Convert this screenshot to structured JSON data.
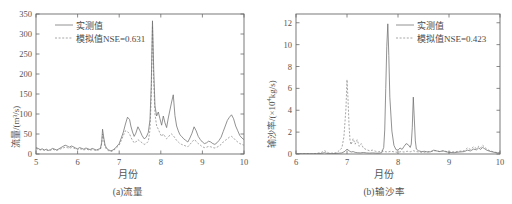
{
  "figure": {
    "background": "#ffffff",
    "line_color_observed": "#6e6e6e",
    "line_color_simulated": "#8a8a8a"
  },
  "panels": {
    "a": {
      "caption": "(a)流量",
      "xlabel": "月份",
      "ylabel": "流量/(m³/s)",
      "legend": {
        "observed": "实测值",
        "simulated": "模拟值NSE=0.631"
      },
      "xticks": [
        "5",
        "6",
        "7",
        "8",
        "9",
        "10"
      ],
      "yticks": [
        "0",
        "50",
        "100",
        "150",
        "200",
        "250",
        "300",
        "350"
      ]
    },
    "b": {
      "caption": "(b)输沙率",
      "xlabel": "月份",
      "ylabel_pre": "输沙率/(×10",
      "ylabel_sup": "4",
      "ylabel_post": "kg/s)",
      "legend": {
        "observed": "实测值",
        "simulated": "模拟值NSE=0.423"
      },
      "xticks": [
        "6",
        "7",
        "8",
        "9",
        "10"
      ],
      "yticks": [
        "0",
        "2",
        "4",
        "6",
        "8",
        "10",
        "12"
      ]
    }
  },
  "chart_data": [
    {
      "type": "line",
      "title": "(a)流量",
      "xlabel": "月份",
      "ylabel": "流量/(m³/s)",
      "xlim": [
        5,
        10
      ],
      "ylim": [
        0,
        350
      ],
      "xticks": [
        5,
        6,
        7,
        8,
        9,
        10
      ],
      "yticks": [
        0,
        50,
        100,
        150,
        200,
        250,
        300,
        350
      ],
      "grid": false,
      "legend_position": "upper-left",
      "series": [
        {
          "name": "实测值",
          "style": "solid",
          "x": [
            5.0,
            5.05,
            5.1,
            5.15,
            5.2,
            5.25,
            5.3,
            5.35,
            5.4,
            5.45,
            5.5,
            5.55,
            5.6,
            5.65,
            5.7,
            5.75,
            5.8,
            5.85,
            5.9,
            5.95,
            6.0,
            6.05,
            6.1,
            6.15,
            6.2,
            6.25,
            6.3,
            6.35,
            6.4,
            6.45,
            6.5,
            6.55,
            6.58,
            6.6,
            6.63,
            6.66,
            6.7,
            6.75,
            6.8,
            6.85,
            6.9,
            6.95,
            7.0,
            7.05,
            7.1,
            7.15,
            7.2,
            7.25,
            7.28,
            7.32,
            7.36,
            7.4,
            7.45,
            7.5,
            7.55,
            7.6,
            7.65,
            7.7,
            7.74,
            7.77,
            7.8,
            7.83,
            7.86,
            7.9,
            7.94,
            7.98,
            8.02,
            8.06,
            8.1,
            8.14,
            8.18,
            8.22,
            8.26,
            8.3,
            8.34,
            8.38,
            8.42,
            8.46,
            8.5,
            8.55,
            8.6,
            8.65,
            8.7,
            8.75,
            8.8,
            8.85,
            8.9,
            8.95,
            9.0,
            9.05,
            9.1,
            9.15,
            9.2,
            9.25,
            9.3,
            9.35,
            9.4,
            9.45,
            9.5,
            9.55,
            9.6,
            9.65,
            9.7,
            9.75,
            9.8,
            9.85,
            9.9,
            9.95,
            10.0
          ],
          "y": [
            16,
            14,
            11,
            13,
            10,
            12,
            9,
            11,
            14,
            12,
            10,
            13,
            16,
            19,
            22,
            20,
            17,
            20,
            18,
            15,
            13,
            16,
            14,
            12,
            15,
            13,
            11,
            14,
            12,
            10,
            12,
            14,
            30,
            62,
            40,
            22,
            14,
            10,
            8,
            10,
            14,
            20,
            26,
            40,
            55,
            75,
            92,
            86,
            70,
            55,
            44,
            52,
            68,
            58,
            46,
            38,
            42,
            54,
            85,
            170,
            333,
            210,
            120,
            95,
            105,
            88,
            72,
            95,
            78,
            66,
            90,
            110,
            130,
            148,
            96,
            70,
            58,
            48,
            44,
            38,
            34,
            30,
            40,
            52,
            68,
            58,
            44,
            36,
            30,
            26,
            28,
            32,
            30,
            26,
            24,
            28,
            34,
            42,
            56,
            70,
            84,
            92,
            98,
            88,
            70,
            58,
            46,
            40,
            36
          ]
        },
        {
          "name": "模拟值NSE=0.631",
          "style": "dashed",
          "x": [
            5.0,
            5.05,
            5.1,
            5.15,
            5.2,
            5.25,
            5.3,
            5.35,
            5.4,
            5.45,
            5.5,
            5.55,
            5.6,
            5.65,
            5.7,
            5.75,
            5.8,
            5.85,
            5.9,
            5.95,
            6.0,
            6.05,
            6.1,
            6.15,
            6.2,
            6.25,
            6.3,
            6.35,
            6.4,
            6.45,
            6.5,
            6.55,
            6.58,
            6.6,
            6.63,
            6.66,
            6.7,
            6.75,
            6.8,
            6.85,
            6.9,
            6.95,
            7.0,
            7.05,
            7.1,
            7.15,
            7.2,
            7.25,
            7.28,
            7.32,
            7.36,
            7.4,
            7.45,
            7.5,
            7.55,
            7.6,
            7.65,
            7.7,
            7.74,
            7.77,
            7.8,
            7.83,
            7.86,
            7.9,
            7.94,
            7.98,
            8.02,
            8.06,
            8.1,
            8.14,
            8.18,
            8.22,
            8.26,
            8.3,
            8.34,
            8.38,
            8.42,
            8.46,
            8.5,
            8.55,
            8.6,
            8.65,
            8.7,
            8.75,
            8.8,
            8.85,
            8.9,
            8.95,
            9.0,
            9.05,
            9.1,
            9.15,
            9.2,
            9.25,
            9.3,
            9.35,
            9.4,
            9.45,
            9.5,
            9.55,
            9.6,
            9.65,
            9.7,
            9.75,
            9.8,
            9.85,
            9.9,
            9.95,
            10.0
          ],
          "y": [
            14,
            12,
            10,
            11,
            9,
            10,
            8,
            9,
            12,
            10,
            9,
            11,
            13,
            15,
            17,
            16,
            14,
            16,
            15,
            13,
            11,
            13,
            12,
            10,
            12,
            11,
            9,
            11,
            10,
            8,
            10,
            12,
            26,
            50,
            34,
            18,
            11,
            8,
            6,
            8,
            12,
            17,
            22,
            34,
            46,
            58,
            56,
            50,
            42,
            34,
            28,
            30,
            36,
            32,
            28,
            24,
            26,
            32,
            60,
            140,
            320,
            180,
            100,
            70,
            62,
            52,
            44,
            50,
            44,
            38,
            42,
            48,
            50,
            46,
            40,
            34,
            30,
            26,
            24,
            22,
            20,
            18,
            24,
            30,
            36,
            32,
            26,
            22,
            18,
            16,
            17,
            19,
            18,
            16,
            15,
            17,
            20,
            24,
            30,
            34,
            38,
            42,
            44,
            40,
            34,
            30,
            26,
            24,
            22
          ]
        }
      ]
    },
    {
      "type": "line",
      "title": "(b)输沙率",
      "xlabel": "月份",
      "ylabel": "输沙率/(×10⁴kg/s)",
      "xlim": [
        6,
        10
      ],
      "ylim": [
        0,
        12.8
      ],
      "xticks": [
        6,
        7,
        8,
        9,
        10
      ],
      "yticks": [
        0,
        2,
        4,
        6,
        8,
        10,
        12
      ],
      "grid": false,
      "legend_position": "upper-right",
      "series": [
        {
          "name": "实测值",
          "style": "solid",
          "x": [
            6.0,
            6.1,
            6.2,
            6.3,
            6.4,
            6.5,
            6.56,
            6.6,
            6.64,
            6.7,
            6.8,
            6.9,
            6.96,
            7.0,
            7.04,
            7.08,
            7.12,
            7.16,
            7.2,
            7.26,
            7.32,
            7.38,
            7.44,
            7.5,
            7.56,
            7.62,
            7.68,
            7.72,
            7.74,
            7.76,
            7.78,
            7.8,
            7.82,
            7.84,
            7.88,
            7.92,
            7.96,
            8.0,
            8.04,
            8.08,
            8.12,
            8.16,
            8.2,
            8.24,
            8.26,
            8.28,
            8.3,
            8.32,
            8.34,
            8.36,
            8.4,
            8.46,
            8.52,
            8.58,
            8.64,
            8.7,
            8.76,
            8.82,
            8.88,
            8.94,
            9.0,
            9.1,
            9.2,
            9.3,
            9.36,
            9.42,
            9.48,
            9.54,
            9.58,
            9.62,
            9.66,
            9.7,
            9.74,
            9.8,
            9.86,
            9.92,
            10.0
          ],
          "y": [
            0.02,
            0.02,
            0.03,
            0.02,
            0.03,
            0.05,
            0.12,
            0.06,
            0.04,
            0.03,
            0.05,
            0.1,
            0.25,
            0.45,
            0.3,
            0.18,
            0.22,
            0.15,
            0.12,
            0.1,
            0.14,
            0.1,
            0.08,
            0.1,
            0.08,
            0.07,
            0.12,
            0.6,
            2.2,
            6.0,
            9.8,
            11.9,
            9.0,
            5.2,
            2.1,
            0.8,
            0.4,
            0.35,
            0.55,
            0.42,
            0.7,
            0.95,
            0.85,
            0.6,
            0.9,
            2.4,
            5.2,
            3.2,
            1.2,
            0.45,
            0.3,
            0.22,
            0.25,
            0.18,
            0.2,
            0.35,
            0.28,
            0.22,
            0.3,
            0.2,
            0.15,
            0.12,
            0.18,
            0.22,
            0.35,
            0.28,
            0.45,
            0.38,
            0.55,
            0.42,
            0.6,
            0.48,
            0.35,
            0.25,
            0.18,
            0.12,
            0.08
          ]
        },
        {
          "name": "模拟值NSE=0.423",
          "style": "dashed",
          "x": [
            6.0,
            6.1,
            6.2,
            6.3,
            6.4,
            6.5,
            6.56,
            6.6,
            6.64,
            6.7,
            6.8,
            6.9,
            6.94,
            6.98,
            7.0,
            7.02,
            7.04,
            7.06,
            7.08,
            7.12,
            7.16,
            7.2,
            7.24,
            7.28,
            7.32,
            7.38,
            7.44,
            7.5,
            7.56,
            7.62,
            7.68,
            7.74,
            7.8,
            7.86,
            7.92,
            8.0,
            8.06,
            8.12,
            8.18,
            8.24,
            8.3,
            8.36,
            8.42,
            8.5,
            8.58,
            8.66,
            8.74,
            8.82,
            8.9,
            9.0,
            9.1,
            9.2,
            9.3,
            9.36,
            9.42,
            9.48,
            9.54,
            9.58,
            9.62,
            9.66,
            9.7,
            9.74,
            9.8,
            9.86,
            9.92,
            10.0
          ],
          "y": [
            0.02,
            0.03,
            0.04,
            0.03,
            0.05,
            0.15,
            0.3,
            0.2,
            0.1,
            0.08,
            0.12,
            0.55,
            1.6,
            4.2,
            6.8,
            5.0,
            2.6,
            1.2,
            0.85,
            1.4,
            0.9,
            1.3,
            0.7,
            0.95,
            0.55,
            0.4,
            0.3,
            0.35,
            0.25,
            0.2,
            0.28,
            0.22,
            0.18,
            0.25,
            0.2,
            0.15,
            0.22,
            0.18,
            0.25,
            0.2,
            0.3,
            0.22,
            0.18,
            0.15,
            0.2,
            0.25,
            0.3,
            0.22,
            0.28,
            0.18,
            0.2,
            0.25,
            0.3,
            0.55,
            0.42,
            0.65,
            0.5,
            0.7,
            0.55,
            0.8,
            0.62,
            0.45,
            0.3,
            0.22,
            0.15,
            0.1
          ]
        }
      ]
    }
  ]
}
